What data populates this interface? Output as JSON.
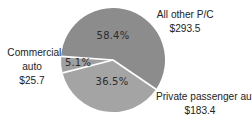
{
  "chart_data": {
    "type": "pie",
    "title": "",
    "unit": "$ billions",
    "categories": [
      "All other P/C",
      "Private passenger auto",
      "Commercial auto"
    ],
    "values": [
      293.5,
      183.4,
      25.7
    ],
    "percentages": [
      58.4,
      36.5,
      5.1
    ],
    "value_labels": [
      "$293.5",
      "$183.4",
      "$25.7"
    ],
    "percent_labels": [
      "58.4%",
      "36.5%",
      "5.1%"
    ],
    "colors": [
      "#8c8c8c",
      "#a4a4a4",
      "#a0a0a0"
    ],
    "separator_color": "#ffffff",
    "legend": "none (direct labels)",
    "start_angle_deg": 184,
    "direction": "clockwise"
  },
  "labels": {
    "other": {
      "name": "All other P/C",
      "value": "$293.5",
      "percent": "58.4%"
    },
    "private": {
      "name": "Private passenger auto",
      "value": "$183.4",
      "percent": "36.5%"
    },
    "commercial": {
      "name_line1": "Commercial",
      "name_line2": "auto",
      "value": "$25.7",
      "percent": "5.1%"
    }
  }
}
